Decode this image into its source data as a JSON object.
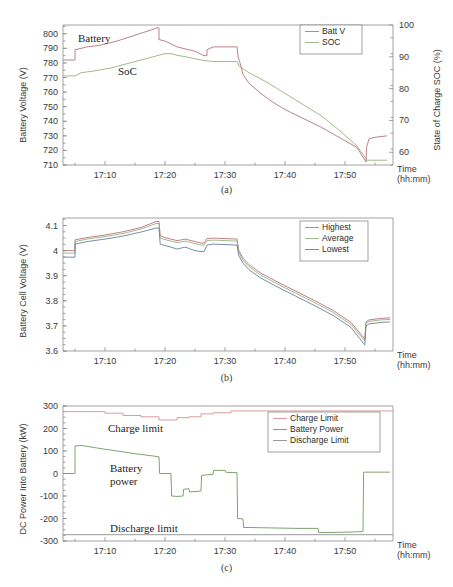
{
  "figure": {
    "title": "",
    "x_tick_labels": [
      "17:10",
      "17:20",
      "17:30",
      "17:40",
      "17:50"
    ],
    "time_axis_label_line1": "Time",
    "time_axis_label_line2": "(hh:mm)"
  },
  "panels": [
    {
      "caption": "(a)",
      "ylabel": "Battery Voltage (V)",
      "y2label": "State of Charge SOC (%)",
      "y_ticks": [
        "800",
        "790",
        "780",
        "770",
        "760",
        "750",
        "740",
        "730",
        "720",
        "710"
      ],
      "y2_ticks": [
        "100",
        "90",
        "80",
        "70",
        "60"
      ],
      "annotations": [
        {
          "name": "battery-label",
          "text": "Battery"
        },
        {
          "name": "soc-label",
          "text": "SoC"
        }
      ],
      "legend": [
        {
          "label": "Batt V",
          "color": "#b5737a"
        },
        {
          "label": "SOC",
          "color": "#9ab07e"
        }
      ]
    },
    {
      "caption": "(b)",
      "ylabel": "Battery Cell Voltage (V)",
      "y_ticks": [
        "4.1",
        "4",
        "3.9",
        "3.8",
        "3.7",
        "3.6"
      ],
      "legend": [
        {
          "label": "Highest",
          "color": "#b5737a"
        },
        {
          "label": "Average",
          "color": "#9ab07e"
        },
        {
          "label": "Lowest",
          "color": "#6b7f9e"
        }
      ]
    },
    {
      "caption": "(c)",
      "ylabel": "DC Power Into Battery (kW)",
      "y_ticks": [
        "300",
        "200",
        "100",
        "0",
        "-100",
        "-200",
        "-300"
      ],
      "annotations": [
        {
          "name": "charge-limit-label",
          "text": "Charge limit"
        },
        {
          "name": "battery-power-label-line1",
          "text": "Battery"
        },
        {
          "name": "battery-power-label-line2",
          "text": "power"
        },
        {
          "name": "discharge-limit-label",
          "text": "Discharge limit"
        }
      ],
      "legend": [
        {
          "label": "Charge Limit",
          "color": "#d78f93"
        },
        {
          "label": "Battery Power",
          "color": "#6f9a5e"
        },
        {
          "label": "Discharge Limit",
          "color": "#8f8f8f"
        }
      ]
    }
  ],
  "chart_data": [
    {
      "type": "line",
      "panel": "(a)",
      "title": "",
      "xlabel": "Time (hh:mm)",
      "ylabel": "Battery Voltage (V)",
      "y2label": "State of Charge SOC (%)",
      "xlim": [
        "17:03",
        "17:58"
      ],
      "ylim": [
        710,
        806
      ],
      "y2lim": [
        56,
        100
      ],
      "xticks": [
        "17:10",
        "17:20",
        "17:30",
        "17:40",
        "17:50"
      ],
      "yticks": [
        710,
        720,
        730,
        740,
        750,
        760,
        770,
        780,
        790,
        800
      ],
      "y2ticks": [
        60,
        70,
        80,
        90,
        100
      ],
      "grid": false,
      "legend_position": "top-right",
      "series": [
        {
          "name": "Batt V",
          "axis": "left",
          "color": "#b5737a",
          "x": [
            "17:03",
            "17:05",
            "17:05",
            "17:07",
            "17:09",
            "17:12",
            "17:15",
            "17:18",
            "17:18.5",
            "17:19",
            "17:19",
            "17:20",
            "17:21",
            "17:22",
            "17:23",
            "17:24",
            "17:25",
            "17:26",
            "17:26.5",
            "17:27",
            "17:27",
            "17:28",
            "17:29",
            "17:30",
            "17:31",
            "17:32",
            "17:32.2",
            "17:32.5",
            "17:33",
            "17:34",
            "17:36",
            "17:38",
            "17:40",
            "17:43",
            "17:46",
            "17:49",
            "17:52",
            "17:53.5",
            "17:53.6",
            "17:54",
            "17:55",
            "17:57"
          ],
          "y": [
            782,
            782,
            789,
            791,
            792,
            795,
            799,
            803,
            804,
            804,
            796,
            795,
            793,
            791,
            790,
            789,
            788,
            786,
            785,
            785,
            789,
            791,
            791,
            791,
            791,
            791,
            784,
            780,
            772,
            766,
            759,
            753,
            748,
            742,
            736,
            729,
            722,
            712,
            722,
            728,
            729,
            730
          ]
        },
        {
          "name": "SOC",
          "axis": "right",
          "color": "#9ab07e",
          "x": [
            "17:03",
            "17:05",
            "17:06",
            "17:08",
            "17:11",
            "17:14",
            "17:17",
            "17:19",
            "17:20",
            "17:21",
            "17:22",
            "17:24",
            "17:26",
            "17:28",
            "17:30",
            "17:32",
            "17:32.4",
            "17:34",
            "17:37",
            "17:40",
            "17:43",
            "17:46",
            "17:49",
            "17:52",
            "17:53.5",
            "17:53.6",
            "17:57"
          ],
          "y": [
            84,
            84,
            85,
            85.5,
            86.5,
            88,
            89.5,
            90.5,
            91,
            91,
            90.5,
            89.8,
            89,
            88.5,
            88.5,
            88.5,
            87,
            85,
            82,
            78.5,
            75,
            71.5,
            67,
            62,
            58,
            57.5,
            57.5
          ]
        }
      ]
    },
    {
      "type": "line",
      "panel": "(b)",
      "title": "",
      "xlabel": "Time (hh:mm)",
      "ylabel": "Battery Cell Voltage (V)",
      "xlim": [
        "17:03",
        "17:58"
      ],
      "ylim": [
        3.6,
        4.13
      ],
      "xticks": [
        "17:10",
        "17:20",
        "17:30",
        "17:40",
        "17:50"
      ],
      "yticks": [
        3.6,
        3.7,
        3.8,
        3.9,
        4.0,
        4.1
      ],
      "grid": false,
      "legend_position": "top-right",
      "series": [
        {
          "name": "Highest",
          "color": "#b5737a",
          "x": [
            "17:03",
            "17:05",
            "17:05",
            "17:07",
            "17:10",
            "17:13",
            "17:16",
            "17:18.5",
            "17:19",
            "17:19.2",
            "17:20",
            "17:21",
            "17:22",
            "17:23",
            "17:23.5",
            "17:24",
            "17:25",
            "17:26",
            "17:26.5",
            "17:27",
            "17:28",
            "17:30",
            "17:32",
            "17:32.3",
            "17:33",
            "17:34",
            "17:36",
            "17:39",
            "17:42",
            "17:45",
            "17:48",
            "17:51",
            "17:53.3",
            "17:53.5",
            "17:54",
            "17:56",
            "17:57.5"
          ],
          "y": [
            4.0,
            4.0,
            4.043,
            4.052,
            4.062,
            4.075,
            4.092,
            4.116,
            4.116,
            4.06,
            4.052,
            4.046,
            4.04,
            4.044,
            4.046,
            4.042,
            4.036,
            4.03,
            4.03,
            4.048,
            4.05,
            4.048,
            4.046,
            4.0,
            3.97,
            3.944,
            3.91,
            3.872,
            3.836,
            3.8,
            3.762,
            3.714,
            3.648,
            3.716,
            3.724,
            3.73,
            3.732
          ]
        },
        {
          "name": "Average",
          "color": "#9ab07e",
          "x": [
            "17:03",
            "17:05",
            "17:05",
            "17:07",
            "17:10",
            "17:13",
            "17:16",
            "17:18.5",
            "17:19",
            "17:19.2",
            "17:20",
            "17:21",
            "17:22",
            "17:23",
            "17:23.5",
            "17:24",
            "17:25",
            "17:26",
            "17:26.5",
            "17:27",
            "17:28",
            "17:30",
            "17:32",
            "17:32.3",
            "17:33",
            "17:34",
            "17:36",
            "17:39",
            "17:42",
            "17:45",
            "17:48",
            "17:51",
            "17:53.3",
            "17:53.5",
            "17:54",
            "17:56",
            "17:57.5"
          ],
          "y": [
            3.99,
            3.99,
            4.036,
            4.046,
            4.056,
            4.068,
            4.086,
            4.108,
            4.108,
            4.05,
            4.044,
            4.038,
            4.032,
            4.036,
            4.038,
            4.034,
            4.028,
            4.022,
            4.022,
            4.04,
            4.042,
            4.04,
            4.038,
            3.992,
            3.962,
            3.936,
            3.902,
            3.864,
            3.828,
            3.792,
            3.754,
            3.706,
            3.64,
            3.71,
            3.718,
            3.724,
            3.726
          ]
        },
        {
          "name": "Lowest",
          "color": "#6b7f9e",
          "x": [
            "17:03",
            "17:05",
            "17:05",
            "17:07",
            "17:10",
            "17:13",
            "17:16",
            "17:18.5",
            "17:19",
            "17:19.2",
            "17:20",
            "17:21",
            "17:22",
            "17:23",
            "17:23.5",
            "17:24",
            "17:25",
            "17:26",
            "17:26.5",
            "17:27",
            "17:28",
            "17:30",
            "17:32",
            "17:32.3",
            "17:33",
            "17:34",
            "17:36",
            "17:39",
            "17:42",
            "17:45",
            "17:48",
            "17:51",
            "17:53.3",
            "17:53.5",
            "17:54",
            "17:56",
            "17:57.5"
          ],
          "y": [
            3.974,
            3.974,
            4.026,
            4.036,
            4.046,
            4.058,
            4.074,
            4.09,
            4.09,
            4.026,
            4.02,
            4.014,
            4.006,
            4.012,
            4.014,
            4.008,
            4.0,
            3.996,
            3.996,
            4.022,
            4.026,
            4.024,
            4.022,
            3.98,
            3.95,
            3.924,
            3.89,
            3.852,
            3.816,
            3.78,
            3.742,
            3.694,
            3.624,
            3.7,
            3.708,
            3.714,
            3.716
          ]
        }
      ]
    },
    {
      "type": "line",
      "panel": "(c)",
      "title": "",
      "xlabel": "Time (hh:mm)",
      "ylabel": "DC Power Into Battery (kW)",
      "xlim": [
        "17:03",
        "17:58"
      ],
      "ylim": [
        -300,
        300
      ],
      "xticks": [
        "17:10",
        "17:20",
        "17:30",
        "17:40",
        "17:50"
      ],
      "yticks": [
        -300,
        -200,
        -100,
        0,
        100,
        200,
        300
      ],
      "grid": false,
      "legend_position": "top-right",
      "series": [
        {
          "name": "Charge Limit",
          "color": "#d78f93",
          "x": [
            "17:03",
            "17:10",
            "17:10",
            "17:13",
            "17:13",
            "17:16",
            "17:16",
            "17:19",
            "17:19",
            "17:22",
            "17:22",
            "17:24",
            "17:24",
            "17:26",
            "17:26",
            "17:28",
            "17:28",
            "17:31",
            "17:31",
            "17:58"
          ],
          "y": [
            275,
            275,
            268,
            268,
            258,
            258,
            252,
            252,
            238,
            238,
            248,
            248,
            252,
            252,
            265,
            265,
            270,
            270,
            278,
            278
          ]
        },
        {
          "name": "Battery Power",
          "color": "#6f9a5e",
          "x": [
            "17:03",
            "17:05",
            "17:05",
            "17:06",
            "17:09",
            "17:12",
            "17:15",
            "17:18",
            "17:19",
            "17:19.1",
            "17:21",
            "17:21.1",
            "17:22",
            "17:23",
            "17:23.1",
            "17:24",
            "17:24.1",
            "17:25",
            "17:26",
            "17:26.1",
            "17:27",
            "17:28",
            "17:28.1",
            "17:29",
            "17:30",
            "17:30.1",
            "17:31",
            "17:32",
            "17:32.1",
            "17:33",
            "17:33.1",
            "17:34",
            "17:38",
            "17:42",
            "17:45.5",
            "17:45.6",
            "17:48",
            "17:51",
            "17:53",
            "17:53.1",
            "17:53.3",
            "17:54",
            "17:56",
            "17:57.5"
          ],
          "y": [
            0,
            0,
            122,
            125,
            112,
            100,
            88,
            78,
            74,
            0,
            0,
            -100,
            -102,
            -100,
            -70,
            -68,
            -82,
            -80,
            -78,
            -8,
            -6,
            -4,
            14,
            14,
            14,
            6,
            4,
            4,
            -200,
            -202,
            -240,
            -240,
            -242,
            -244,
            -244,
            -262,
            -262,
            -260,
            -258,
            6,
            6,
            6,
            6,
            6
          ]
        },
        {
          "name": "Discharge Limit",
          "color": "#8f8f8f",
          "x": [
            "17:03",
            "17:58"
          ],
          "y": [
            -272,
            -272
          ]
        }
      ]
    }
  ]
}
